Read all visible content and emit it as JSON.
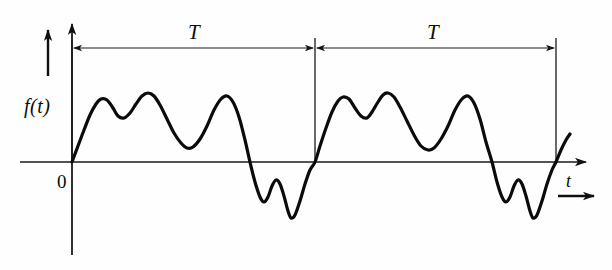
{
  "figure": {
    "title_label": "",
    "background_color": "#fefefe",
    "stroke_color": "#0b0b0b",
    "axis_color": "#1a1a1a",
    "labels": {
      "y_axis": "f(t)",
      "x_axis": "t",
      "origin": "0",
      "period_first": "T",
      "period_second": "T"
    },
    "icons": {
      "y_axis_arrow": "arrow-up-icon",
      "x_axis_arrow": "arrow-right-icon",
      "direction_arrow": "arrow-right-icon",
      "period_arrow_left": "arrow-left-icon",
      "period_arrow_right": "arrow-right-icon"
    }
  },
  "chart_data": {
    "type": "line",
    "xlabel": "t",
    "ylabel": "f(t)",
    "grid": false,
    "legend": null,
    "axes": {
      "origin_label": "0",
      "x_axis_y_pixel": 162,
      "y_axis_x_pixel": 72,
      "x_range_px": [
        72,
        590
      ],
      "y_range_px": [
        18,
        255
      ]
    },
    "annotations": [
      {
        "label": "T",
        "type": "span-arrow",
        "x_start_px": 72,
        "x_end_px": 315,
        "y_px": 48,
        "label_x_px": 195,
        "label_y_px": 30
      },
      {
        "label": "T",
        "type": "span-arrow",
        "x_start_px": 315,
        "x_end_px": 556,
        "y_px": 48,
        "label_x_px": 434,
        "label_y_px": 30
      }
    ],
    "period_markers_x_px": [
      72,
      315,
      556
    ],
    "period_px": 243,
    "series": [
      {
        "name": "f(t)",
        "stroke_width": 3.2,
        "points_px": [
          [
            72,
            162
          ],
          [
            78,
            146
          ],
          [
            84,
            130
          ],
          [
            90,
            115
          ],
          [
            96,
            104
          ],
          [
            101,
            99
          ],
          [
            107,
            100
          ],
          [
            113,
            108
          ],
          [
            118,
            116
          ],
          [
            124,
            118
          ],
          [
            130,
            113
          ],
          [
            136,
            104
          ],
          [
            142,
            96
          ],
          [
            148,
            93
          ],
          [
            154,
            96
          ],
          [
            160,
            105
          ],
          [
            167,
            119
          ],
          [
            174,
            133
          ],
          [
            181,
            143
          ],
          [
            187,
            148
          ],
          [
            193,
            147
          ],
          [
            200,
            139
          ],
          [
            207,
            126
          ],
          [
            214,
            110
          ],
          [
            221,
            99
          ],
          [
            227,
            96
          ],
          [
            233,
            102
          ],
          [
            239,
            117
          ],
          [
            245,
            140
          ],
          [
            250,
            162
          ],
          [
            255,
            182
          ],
          [
            260,
            197
          ],
          [
            264,
            202
          ],
          [
            268,
            197
          ],
          [
            272,
            186
          ],
          [
            276,
            180
          ],
          [
            280,
            184
          ],
          [
            284,
            196
          ],
          [
            288,
            211
          ],
          [
            291,
            218
          ],
          [
            295,
            215
          ],
          [
            300,
            201
          ],
          [
            305,
            184
          ],
          [
            310,
            170
          ],
          [
            315,
            162
          ],
          [
            320,
            146
          ],
          [
            326,
            128
          ],
          [
            332,
            112
          ],
          [
            338,
            101
          ],
          [
            343,
            97
          ],
          [
            349,
            99
          ],
          [
            355,
            108
          ],
          [
            361,
            116
          ],
          [
            367,
            118
          ],
          [
            372,
            112
          ],
          [
            378,
            102
          ],
          [
            383,
            95
          ],
          [
            388,
            93
          ],
          [
            394,
            97
          ],
          [
            400,
            107
          ],
          [
            407,
            121
          ],
          [
            414,
            135
          ],
          [
            421,
            146
          ],
          [
            428,
            150
          ],
          [
            434,
            148
          ],
          [
            441,
            139
          ],
          [
            448,
            126
          ],
          [
            455,
            110
          ],
          [
            462,
            99
          ],
          [
            468,
            96
          ],
          [
            474,
            103
          ],
          [
            480,
            119
          ],
          [
            486,
            142
          ],
          [
            492,
            162
          ],
          [
            497,
            182
          ],
          [
            502,
            197
          ],
          [
            506,
            202
          ],
          [
            510,
            197
          ],
          [
            514,
            186
          ],
          [
            518,
            180
          ],
          [
            522,
            184
          ],
          [
            526,
            196
          ],
          [
            530,
            211
          ],
          [
            533,
            218
          ],
          [
            537,
            215
          ],
          [
            542,
            201
          ],
          [
            547,
            184
          ],
          [
            552,
            170
          ],
          [
            556,
            162
          ],
          [
            561,
            150
          ],
          [
            566,
            140
          ],
          [
            570,
            134
          ]
        ],
        "description": "Two identical cycles: rises from origin to a first peak, small dip, higher second peak, broad trough above axis, third peak, then steep fall below axis into two negative troughs separated by a small bump, returning to zero at the end of each period."
      }
    ]
  }
}
